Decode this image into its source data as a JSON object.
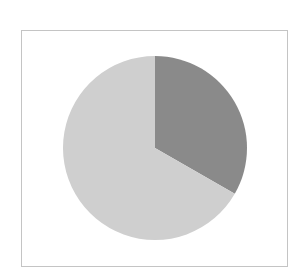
{
  "chart_data": {
    "type": "pie",
    "title": "",
    "labels": [
      "Slice A",
      "Slice B"
    ],
    "values": [
      33.3,
      66.7
    ],
    "colors": [
      "#8a8a8a",
      "#cfcfcf"
    ],
    "start_angle_deg": 0,
    "direction": "clockwise",
    "legend": "none",
    "data_labels": "none",
    "center": [
      155,
      148
    ],
    "radius": 92
  },
  "frame": {
    "border_color": "#c4c4c4",
    "background": "#ffffff"
  }
}
